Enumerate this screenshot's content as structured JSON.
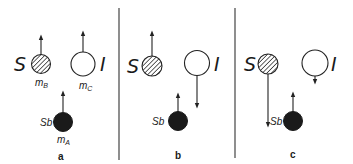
{
  "figure": {
    "panels": [
      {
        "id": "a",
        "label": "a",
        "S": {
          "label": "S",
          "mass_label": "m",
          "mass_sub": "B",
          "arrow": "up"
        },
        "I": {
          "label": "I",
          "mass_label": "m",
          "mass_sub": "C",
          "arrow": "up"
        },
        "Sb": {
          "label": "Sb",
          "mass_label": "m",
          "mass_sub": "A",
          "arrow": "up"
        }
      },
      {
        "id": "b",
        "label": "b",
        "S": {
          "label": "S",
          "arrow": "up"
        },
        "I": {
          "label": "I",
          "arrow": "down-long"
        },
        "Sb": {
          "label": "Sb",
          "arrow": "up"
        }
      },
      {
        "id": "c",
        "label": "c",
        "S": {
          "label": "S",
          "arrow": "down-long"
        },
        "I": {
          "label": "I",
          "arrow": "down-short"
        },
        "Sb": {
          "label": "Sb",
          "arrow": "up"
        }
      }
    ],
    "legend": {
      "S": "hatched sphere",
      "I": "open sphere",
      "Sb": "filled sphere"
    },
    "colors": {
      "ink": "#1a1a1a",
      "background": "#ffffff"
    }
  }
}
